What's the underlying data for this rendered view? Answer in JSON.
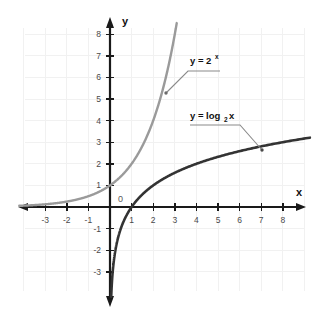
{
  "chart_data": {
    "type": "line",
    "title": "",
    "subtitle": "",
    "xlabel": "x",
    "ylabel": "y",
    "xlim": [
      -3.9,
      8.8
    ],
    "ylim": [
      -3.9,
      8.7
    ],
    "grid": true,
    "grid_spacing": 1,
    "legend_position": "inline-annotations",
    "origin_label": "0",
    "x_ticks": [
      -3,
      -2,
      -1,
      1,
      2,
      3,
      4,
      5,
      6,
      7,
      8
    ],
    "x_tick_labels": [
      "-3",
      "-2",
      "-1",
      "1",
      "2",
      "3",
      "4",
      "5",
      "6",
      "7",
      "8"
    ],
    "y_ticks": [
      -3,
      -2,
      -1,
      1,
      2,
      3,
      4,
      5,
      6,
      7,
      8
    ],
    "y_tick_labels": [
      "-3",
      "-2",
      "-1",
      "1",
      "2",
      "3",
      "4",
      "5",
      "6",
      "7",
      "8"
    ],
    "series": [
      {
        "name": "y = 2^x",
        "label_text": "y = 2",
        "label_exponent": "x",
        "color": "#9a9a9a",
        "equation": "y = 2^x",
        "x": [
          -3.9,
          -3.5,
          -3,
          -2.5,
          -2,
          -1.5,
          -1,
          -0.5,
          0,
          0.5,
          1,
          1.5,
          2,
          2.5,
          2.8,
          3,
          3.15
        ],
        "y": [
          0.067,
          0.088,
          0.125,
          0.177,
          0.25,
          0.354,
          0.5,
          0.707,
          1,
          1.414,
          2,
          2.828,
          4,
          5.657,
          6.964,
          8,
          8.87
        ]
      },
      {
        "name": "y = log2 x",
        "label_text": "y = log",
        "label_subscript": "2",
        "label_suffix": " x",
        "color": "#333333",
        "equation": "y = log_2 x",
        "x": [
          0.07,
          0.09,
          0.125,
          0.177,
          0.25,
          0.354,
          0.5,
          0.707,
          1,
          1.414,
          2,
          2.828,
          4,
          5.657,
          7,
          8,
          8.8
        ],
        "y": [
          -3.84,
          -3.47,
          -3,
          -2.5,
          -2,
          -1.5,
          -1,
          -0.5,
          0,
          0.5,
          1,
          1.5,
          2,
          2.5,
          2.807,
          3,
          3.138
        ]
      }
    ],
    "annotations": [
      {
        "name": "exponential-label",
        "text": "y = 2^x",
        "anchor_x": 2.5,
        "anchor_y": 5.8
      },
      {
        "name": "logarithmic-label",
        "text": "y = log_2 x",
        "anchor_x": 7.5,
        "anchor_y": 2.9
      }
    ]
  },
  "axes": {
    "x_name": "x",
    "y_name": "y",
    "origin": "0"
  },
  "colors": {
    "background": "#ffffff",
    "grid": "#f0f0f0",
    "axis": "#1a1a1a",
    "exponential_curve": "#9a9a9a",
    "log_curve": "#333333",
    "leader_line": "#8a8a8a",
    "tick_text": "#4a4a4a"
  },
  "ticks": {
    "x": [
      {
        "value": -3,
        "label": "-3"
      },
      {
        "value": -2,
        "label": "-2"
      },
      {
        "value": -1,
        "label": "-1"
      },
      {
        "value": 1,
        "label": "1"
      },
      {
        "value": 2,
        "label": "2"
      },
      {
        "value": 3,
        "label": "3"
      },
      {
        "value": 4,
        "label": "4"
      },
      {
        "value": 5,
        "label": "5"
      },
      {
        "value": 6,
        "label": "6"
      },
      {
        "value": 7,
        "label": "7"
      },
      {
        "value": 8,
        "label": "8"
      }
    ],
    "y": [
      {
        "value": 8,
        "label": "8"
      },
      {
        "value": 7,
        "label": "7"
      },
      {
        "value": 6,
        "label": "6"
      },
      {
        "value": 5,
        "label": "5"
      },
      {
        "value": 4,
        "label": "4"
      },
      {
        "value": 3,
        "label": "3"
      },
      {
        "value": 2,
        "label": "2"
      },
      {
        "value": 1,
        "label": "1"
      },
      {
        "value": -1,
        "label": "-1"
      },
      {
        "value": -2,
        "label": "-2"
      },
      {
        "value": -3,
        "label": "-3"
      }
    ]
  },
  "labels": {
    "exp_main": "y = 2",
    "exp_sup": "x",
    "log_main": "y = log",
    "log_sub": "2",
    "log_tail": "x"
  }
}
